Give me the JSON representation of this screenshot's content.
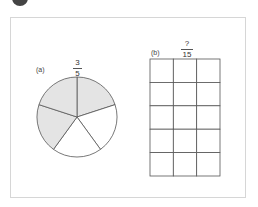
{
  "figure": {
    "part_a": {
      "label": "(a)",
      "fraction": {
        "numerator": "3",
        "denominator": "5"
      },
      "pie": {
        "slices": 5,
        "shaded": 3,
        "shade_color": "#e4e4e4",
        "stroke_color": "#555555"
      }
    },
    "part_b": {
      "label": "(b)",
      "fraction": {
        "numerator": "?",
        "denominator": "15"
      },
      "grid": {
        "rows": 5,
        "cols": 3,
        "stroke_color": "#555555"
      }
    }
  }
}
